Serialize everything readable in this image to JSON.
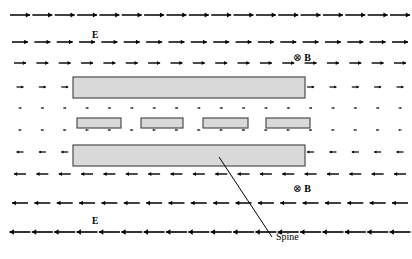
{
  "figure": {
    "type": "physics-field-diagram",
    "width": 412,
    "height": 259,
    "background": "#ffffff",
    "stroke": "#000000"
  },
  "labels": {
    "e_field_top": {
      "text": "E",
      "x": 92,
      "y": 30
    },
    "e_field_bottom": {
      "text": "E",
      "x": 92,
      "y": 216
    },
    "b_field_top": {
      "cross": "⊗",
      "text": "B",
      "x": 293,
      "y": 51
    },
    "b_field_bottom": {
      "cross": "⊗",
      "text": "B",
      "x": 293,
      "y": 182
    },
    "spine": {
      "text": "Spine",
      "x": 276,
      "y": 231
    }
  },
  "leader_line": {
    "name": "spine-leader-line",
    "x1": 219,
    "y1": 157,
    "x2": 272,
    "y2": 237,
    "color": "#000000",
    "width": 1
  },
  "field_rows": [
    {
      "id": "row-1",
      "y": 15,
      "direction": "right",
      "length": 20,
      "head": 4.2,
      "thickness": 1.5,
      "count": 18
    },
    {
      "id": "row-2",
      "y": 42,
      "direction": "right",
      "length": 16,
      "head": 3.8,
      "thickness": 1.5,
      "count": 18
    },
    {
      "id": "row-3",
      "y": 63,
      "direction": "right",
      "length": 12,
      "head": 3.2,
      "thickness": 1.4,
      "count": 18
    },
    {
      "id": "row-4",
      "y": 87,
      "direction": "right",
      "length": 7,
      "head": 2.3,
      "thickness": 1.2,
      "count": 18
    },
    {
      "id": "row-5",
      "y": 108,
      "direction": "right",
      "length": 3,
      "head": 1.4,
      "thickness": 1.0,
      "count": 18
    },
    {
      "id": "row-6",
      "y": 130,
      "direction": "left",
      "length": 3,
      "head": 1.4,
      "thickness": 1.0,
      "count": 18
    },
    {
      "id": "row-7",
      "y": 152,
      "direction": "left",
      "length": 7,
      "head": 2.3,
      "thickness": 1.2,
      "count": 18
    },
    {
      "id": "row-8",
      "y": 174,
      "direction": "left",
      "length": 12,
      "head": 3.2,
      "thickness": 1.4,
      "count": 18
    },
    {
      "id": "row-9",
      "y": 203,
      "direction": "left",
      "length": 16,
      "head": 3.8,
      "thickness": 1.5,
      "count": 18
    },
    {
      "id": "row-10",
      "y": 232,
      "direction": "left",
      "length": 21,
      "head": 4.4,
      "thickness": 1.6,
      "count": 18
    }
  ],
  "row_geometry": {
    "x_start": 20,
    "x_end": 400
  },
  "antenna_elements": {
    "fill": "#d9d9d9",
    "stroke": "#4d4d4d",
    "stroke_width": 1.2,
    "bars": [
      {
        "name": "upper-spine-bar",
        "x": 73,
        "y": 77,
        "w": 232,
        "h": 21
      },
      {
        "name": "element-bar-1",
        "x": 77,
        "y": 118,
        "w": 44,
        "h": 10
      },
      {
        "name": "element-bar-2",
        "x": 141,
        "y": 118,
        "w": 42,
        "h": 10
      },
      {
        "name": "element-bar-3",
        "x": 203,
        "y": 118,
        "w": 45,
        "h": 10
      },
      {
        "name": "element-bar-4",
        "x": 266,
        "y": 118,
        "w": 44,
        "h": 10
      },
      {
        "name": "lower-spine-bar",
        "x": 73,
        "y": 145,
        "w": 232,
        "h": 21
      }
    ]
  }
}
